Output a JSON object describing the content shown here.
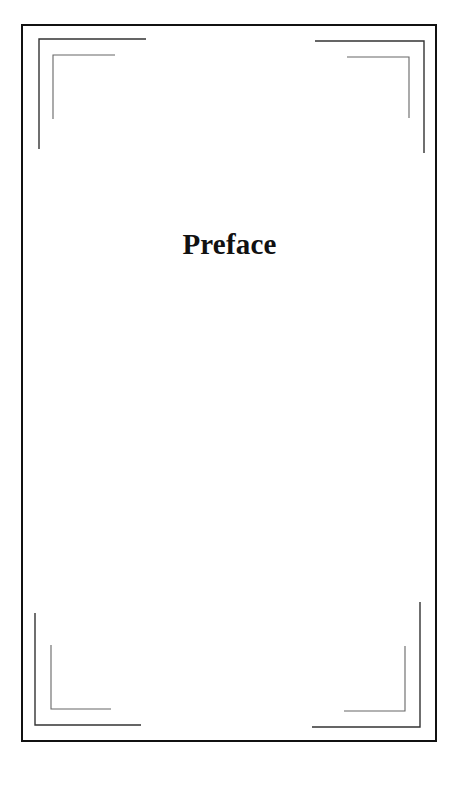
{
  "page": {
    "title": "Preface"
  },
  "colors": {
    "frame": "#111111",
    "middle_line": "#333333",
    "inner_line": "#666666",
    "background": "#ffffff"
  }
}
